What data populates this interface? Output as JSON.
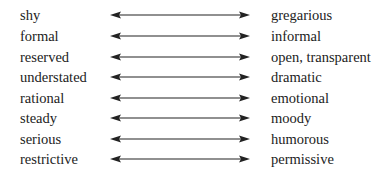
{
  "pairs": [
    {
      "left": "shy",
      "right": "gregarious"
    },
    {
      "left": "formal",
      "right": "informal"
    },
    {
      "left": "reserved",
      "right": "open, transparent"
    },
    {
      "left": "understated",
      "right": "dramatic"
    },
    {
      "left": "rational",
      "right": "emotional"
    },
    {
      "left": "steady",
      "right": "moody"
    },
    {
      "left": "serious",
      "right": "humorous"
    },
    {
      "left": "restrictive",
      "right": "permissive"
    }
  ],
  "colors": {
    "text": "#222222",
    "arrow": "#222222",
    "background": "#ffffff"
  },
  "icons": {
    "arrow": "double-headed-arrow"
  }
}
